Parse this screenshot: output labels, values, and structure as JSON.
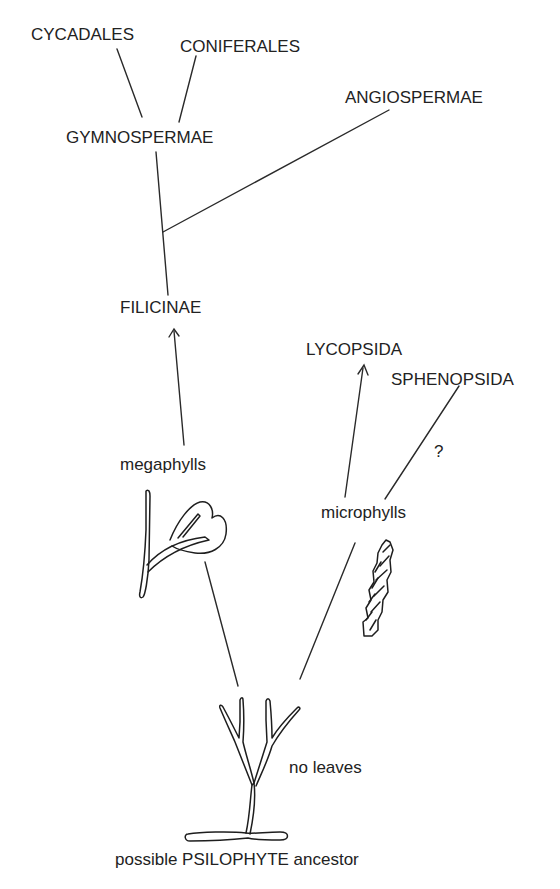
{
  "diagram": {
    "type": "evolutionary-tree",
    "nodes": {
      "cycadales": "CYCADALES",
      "coniferales": "CONIFERALES",
      "angiospermae": "ANGIOSPERMAE",
      "gymnospermae": "GYMNOSPERMAE",
      "filicinae": "FILICINAE",
      "lycopsida": "LYCOPSIDA",
      "sphenopsida": "SPHENOPSIDA",
      "uncertain_mark": "?",
      "megaphylls": "megaphylls",
      "microphylls": "microphylls",
      "no_leaves": "no leaves",
      "ancestor": "possible PSILOPHYTE ancestor"
    },
    "edges": [
      {
        "from": "gymnospermae",
        "to": "cycadales",
        "arrow": false
      },
      {
        "from": "gymnospermae",
        "to": "coniferales",
        "arrow": false
      },
      {
        "from": "filicinae",
        "to": "gymnospermae",
        "arrow": false
      },
      {
        "from": "filicinae-branch",
        "to": "angiospermae",
        "arrow": false
      },
      {
        "from": "megaphylls",
        "to": "filicinae",
        "arrow": true
      },
      {
        "from": "microphylls",
        "to": "lycopsida",
        "arrow": true
      },
      {
        "from": "microphylls",
        "to": "sphenopsida",
        "arrow": false,
        "label": "?"
      },
      {
        "from": "ancestor",
        "to": "megaphylls",
        "arrow": false
      },
      {
        "from": "ancestor",
        "to": "microphylls",
        "arrow": false
      }
    ],
    "illustrations": [
      "megaphyll-frond-drawing",
      "microphyll-cone-drawing",
      "psilophyte-dichotomous-branching-drawing"
    ],
    "colors": {
      "ink": "#222222",
      "background": "#ffffff"
    }
  }
}
